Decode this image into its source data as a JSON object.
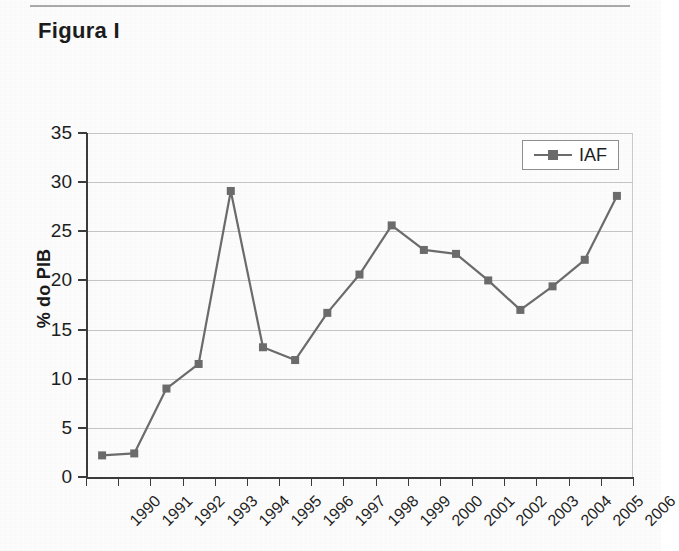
{
  "figure": {
    "title": "Figura I"
  },
  "legend": {
    "entries": [
      "IAF"
    ],
    "position": "top-right",
    "symbol": "line-square-marker"
  },
  "chart_data": {
    "type": "line",
    "title": "",
    "xlabel": "",
    "ylabel": "% do PIB",
    "ylim": [
      0,
      35
    ],
    "yticks": [
      0,
      5,
      10,
      15,
      20,
      25,
      30,
      35
    ],
    "grid": true,
    "categories": [
      "1990",
      "1991",
      "1992",
      "1993",
      "1994",
      "1995",
      "1996",
      "1997",
      "1998",
      "1999",
      "2000",
      "2001",
      "2002",
      "2003",
      "2004",
      "2005",
      "2006"
    ],
    "series": [
      {
        "name": "IAF",
        "color": "#6b6b6b",
        "marker": "square",
        "values": [
          2.2,
          2.4,
          9.0,
          11.5,
          29.1,
          13.2,
          11.9,
          16.7,
          20.6,
          25.6,
          23.1,
          22.7,
          20.0,
          17.0,
          19.4,
          22.1,
          28.6
        ]
      }
    ]
  },
  "colors": {
    "series": "#6b6b6b",
    "axis": "#3b3b3b",
    "grid": "#c4c4c4",
    "text": "#1e1e1e",
    "paper": "#fdfdfd"
  }
}
